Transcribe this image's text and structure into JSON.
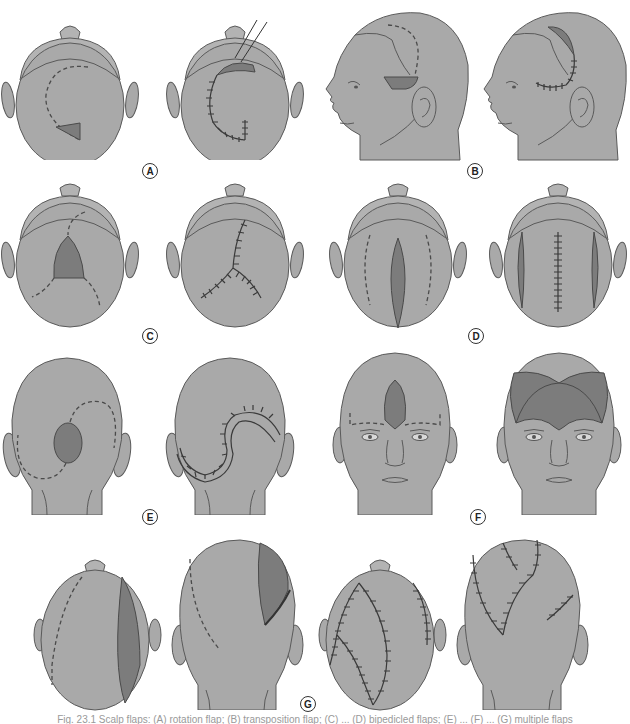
{
  "figure": {
    "panels": [
      {
        "id": "A",
        "label": "A",
        "description": "Rotation flap, top view: planned curved incision with triangular defect, then sutured result"
      },
      {
        "id": "B",
        "label": "B",
        "description": "Lateral head view: planned curved flap above ear, then transposed flap sutured"
      },
      {
        "id": "C",
        "label": "C",
        "description": "Top view: central defect with branching incisions, then Y-shaped sutured closure"
      },
      {
        "id": "D",
        "label": "D",
        "description": "Top view: elliptical central defect with parallel relaxing incisions, then linear closure with lateral defects"
      },
      {
        "id": "E",
        "label": "E",
        "description": "Posterior view: round defect with S-shaped double rotation incisions, then S-shaped sutured closure"
      },
      {
        "id": "F",
        "label": "F",
        "description": "Frontal face view: forehead defect with horizontal incision, then bilateral forehead flaps"
      },
      {
        "id": "G",
        "label": "G",
        "description": "Large scalp defect, top and posterior views: planned flaps and multiple sutured closures"
      }
    ],
    "colors": {
      "skin": "#a9a9a9",
      "flap": "#7c7c7c",
      "outline": "#5a5a5a",
      "suture": "#3a3a3a"
    }
  },
  "caption": "Fig. 23.1 Scalp flaps: (A) rotation flap; (B) transposition flap; (C) ... (D) bipedicled flaps; (E) ... (F) ... (G) multiple flaps"
}
